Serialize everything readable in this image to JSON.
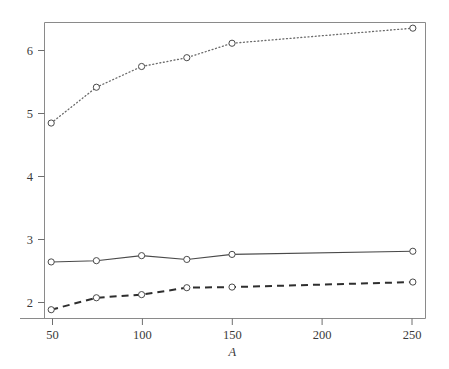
{
  "chart_data": {
    "type": "line",
    "title": "",
    "subtitle": "",
    "xlabel": "A",
    "ylabel": "",
    "x": [
      50,
      75,
      100,
      125,
      150,
      250
    ],
    "xticks": [
      50,
      100,
      150,
      200,
      250
    ],
    "xticklabels": [
      "50",
      "100",
      "150",
      "200",
      "250"
    ],
    "yticks": [
      2,
      3,
      4,
      5,
      6
    ],
    "yticklabels": [
      "2",
      "3",
      "4",
      "5",
      "6"
    ],
    "xlim": [
      46.3,
      257.0
    ],
    "ylim": [
      1.73,
      6.44
    ],
    "grid": false,
    "legend": "none",
    "marker": "open-circle",
    "series": [
      {
        "name": "dotted-series",
        "linestyle": "dotted",
        "color": "#6a6a6a",
        "values": [
          4.84,
          5.41,
          5.74,
          5.88,
          6.11,
          6.35
        ]
      },
      {
        "name": "solid-series",
        "linestyle": "solid",
        "color": "#4a4a4a",
        "values": [
          2.63,
          2.65,
          2.73,
          2.67,
          2.75,
          2.8
        ]
      },
      {
        "name": "dashed-series",
        "linestyle": "dashed",
        "color": "#2e2e2e",
        "values": [
          1.87,
          2.06,
          2.11,
          2.22,
          2.23,
          2.31
        ]
      }
    ]
  },
  "figure": {
    "background_color": "#ffffff",
    "frame_color": "#8a8a8a",
    "text_color": "#3a3a3a",
    "axis_title_text": "A"
  }
}
